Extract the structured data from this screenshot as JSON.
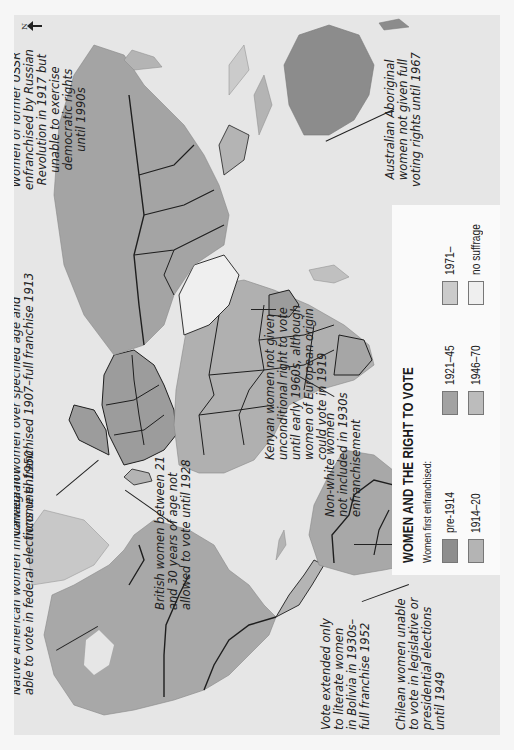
{
  "legend": {
    "title": "WOMEN AND THE RIGHT TO VOTE",
    "subtitle": "Women first enfranchised:",
    "items": [
      {
        "label": "pre-1914",
        "color": "#8e8e8e"
      },
      {
        "label": "1914–20",
        "color": "#b4b4b4"
      },
      {
        "label": "1921–45",
        "color": "#a2a2a2"
      },
      {
        "label": "1946–70",
        "color": "#bcbcbc"
      },
      {
        "label": "1971–",
        "color": "#cbcbcb"
      },
      {
        "label": "no suffrage",
        "color": "#efefef"
      }
    ]
  },
  "north_arrow": {
    "label": "N"
  },
  "colors": {
    "page": "#f6f6f6",
    "sea": "#e6e6e6",
    "border": "#1e1e1e"
  },
  "annotations": {
    "native_american": "Native American women in Canada not\nable to vote in federal elections until 1950",
    "norwegian": "Norwegian women over specified age and\nincome enfranchised 1907–full franchise 1913",
    "ussr": "Women of former USSR\nenfranchised by Russian\nRevolution in 1917 but\nunable to exercise\ndemocratic rights\nuntil 1990s",
    "british": "British women between 21\nand 30 years of age not\nallowed to vote until 1928",
    "non_white": "Non-white women\nnot included in 1930s\nenfranchisement",
    "kenyan": "Kenyan women not given\nunconditional right to vote\nuntil early 1960s, although\nwomen of European origin\ncould vote in 1919",
    "australian": "Australian Aboriginal\nwomen not given full\nvoting rights until 1967",
    "bolivia": "Vote extended only\nto literate women\nin Bolivia in 1930s–\nfull franchise 1952",
    "chilean": "Chilean women unable\nto vote in legislative or\npresidential elections\nuntil 1949"
  }
}
